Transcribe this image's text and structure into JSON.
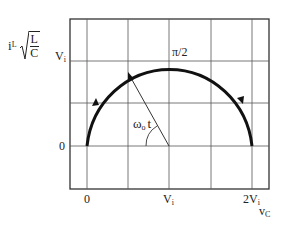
{
  "diagram": {
    "type": "state-plane trajectory",
    "y_axis_label": {
      "main": "i",
      "subscript": "L",
      "sqrt_numerator": "L",
      "sqrt_denominator": "C"
    },
    "x_axis_label": {
      "main": "v",
      "subscript": "C"
    },
    "y_ticks": [
      {
        "label_main": "V",
        "label_sub": "i"
      },
      {
        "label_main": "0",
        "label_sub": ""
      }
    ],
    "x_ticks": [
      {
        "label_main": "0",
        "label_sub": ""
      },
      {
        "label_main": "V",
        "label_sub": "i"
      },
      {
        "label_main": "2V",
        "label_sub": "i"
      }
    ],
    "annotations": {
      "angle_label_main": "ω",
      "angle_label_sub": "o",
      "angle_label_suffix": "t",
      "top_label": "π/2"
    },
    "colors": {
      "curve": "#111111",
      "grid": "#555555",
      "frame": "#333333"
    }
  }
}
